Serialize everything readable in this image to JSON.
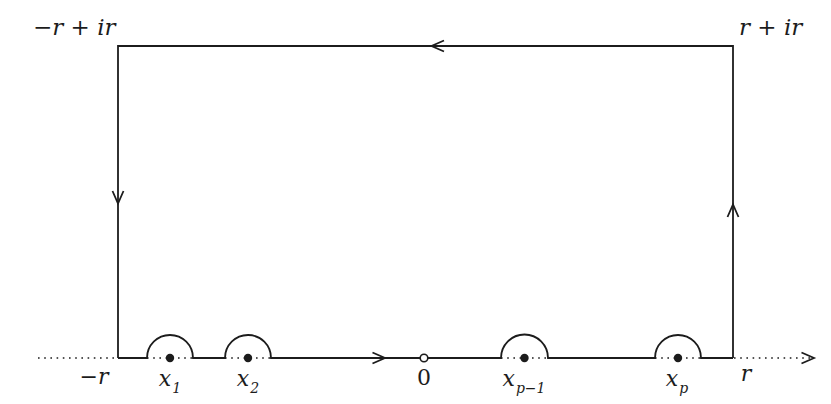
{
  "colors": {
    "background": "#ffffff",
    "ink": "#1c1c1c"
  },
  "labels": {
    "top_left_corner": "−r + ir",
    "top_right_corner": "r + ir",
    "axis_left_end": "−r",
    "axis_right_end": "r",
    "origin": "0",
    "poles": [
      {
        "base": "x",
        "sub": "1"
      },
      {
        "base": "x",
        "sub": "2"
      },
      {
        "base": "x",
        "sub": "p−1"
      },
      {
        "base": "x",
        "sub": "p"
      }
    ]
  },
  "diagram": {
    "type": "complex-plane contour (rectangle with semicircular indentations around real poles)",
    "contour_direction": "counterclockwise",
    "marked_points_on_real_axis": [
      "−r",
      "x1",
      "x2",
      "0",
      "x(p−1)",
      "xp",
      "r"
    ],
    "origin_marker": "open-circle",
    "pole_marker": "filled-dot",
    "real_axis_style": "dotted outside contour and under each semicircle"
  }
}
